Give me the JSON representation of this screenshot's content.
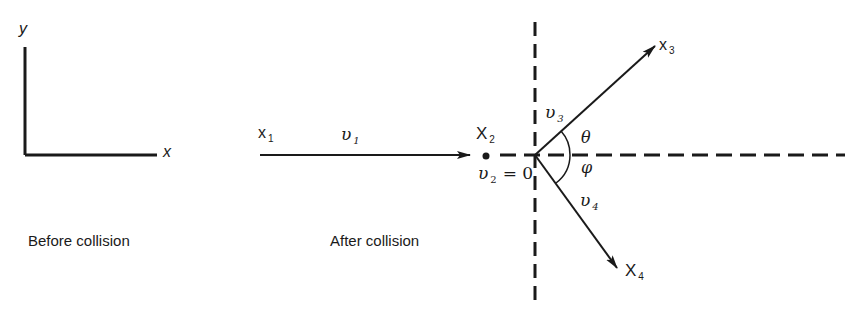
{
  "axes_frame": {
    "x_label": "x",
    "y_label": "y"
  },
  "captions": {
    "left": "Before collision",
    "middle": "After collision"
  },
  "particles": {
    "x1": {
      "label": "x",
      "sub": "1"
    },
    "x2": {
      "label": "X",
      "sub": "2"
    },
    "x3": {
      "label": "x",
      "sub": "3"
    },
    "x4": {
      "label": "X",
      "sub": "4"
    }
  },
  "velocities": {
    "v1": {
      "label": "υ",
      "sub": "1"
    },
    "v2": {
      "label": "υ",
      "sub": "2",
      "eq": "= 0"
    },
    "v3": {
      "label": "υ",
      "sub": "3"
    },
    "v4": {
      "label": "υ",
      "sub": "4"
    }
  },
  "angles": {
    "theta": "θ",
    "phi": "φ"
  },
  "colors": {
    "ink": "#1a1a1a",
    "background": "#ffffff"
  }
}
